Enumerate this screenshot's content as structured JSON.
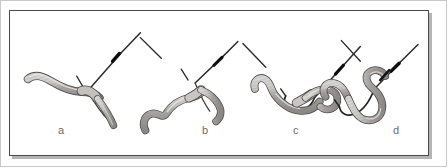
{
  "figure": {
    "caption": "",
    "background_color": "#ffffff",
    "frame": {
      "border_color": "#4a4a4a",
      "shadow_color": "#b4b4b4",
      "outer_rule_color": "#c8c8c8"
    },
    "palette": {
      "worm_fill": "#a8a5a2",
      "worm_highlight": "#d8d6d3",
      "worm_outline": "#4f4d4b",
      "hook_line": "#2b2b2b",
      "knot_dark": "#141414",
      "label_color": "#6b6b6b"
    },
    "panels": [
      {
        "id": "a",
        "label": "a",
        "label_x": 57,
        "label_y": 124,
        "description": "Worm lying straight; hook point just entering the head end of the worm."
      },
      {
        "id": "b",
        "label": "b",
        "label_x": 201,
        "label_y": 124,
        "description": "Hook pushed further; worm begins to slide up the bend of the hook."
      },
      {
        "id": "c",
        "label": "c",
        "label_x": 292,
        "label_y": 124,
        "description": "Worm threaded around the hook bend, body curving over the shank."
      },
      {
        "id": "d",
        "label": "d",
        "label_x": 392,
        "label_y": 124,
        "description": "Worm fully threaded up the shank, coiled over the hook eye and knot."
      }
    ]
  }
}
